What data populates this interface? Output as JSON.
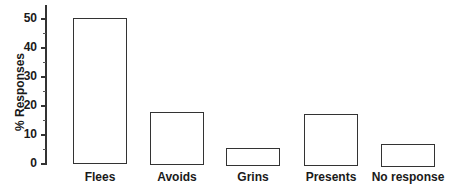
{
  "chart_data": {
    "type": "bar",
    "title": "",
    "xlabel": "",
    "ylabel": "% Responses",
    "categories": [
      "Flees",
      "Avoids",
      "Grins",
      "Presents",
      "No response"
    ],
    "values": [
      50,
      18,
      6,
      17.5,
      7.5
    ],
    "ylim": [
      0,
      50
    ],
    "yticks": [
      0,
      10,
      20,
      30,
      40,
      50
    ],
    "grid": false,
    "legend": null
  }
}
